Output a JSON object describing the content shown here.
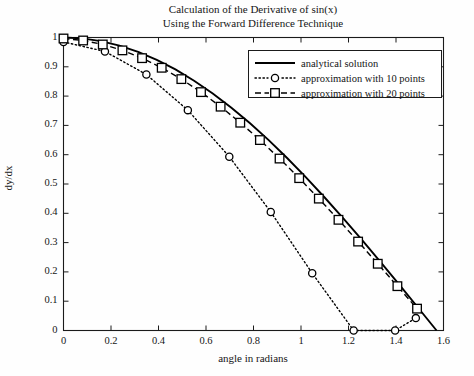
{
  "figure": {
    "title_line1": "Calculation of the Derivative of sin(x)",
    "title_line2": "Using the Forward Difference Technique",
    "xlabel": "angle in radians",
    "ylabel": "dy/dx",
    "background_color": "#fefefe",
    "axis_color": "#1b1b1b"
  },
  "axes": {
    "x_ticklabels": [
      "0",
      "0.2",
      "0.4",
      "0.6",
      "0.8",
      "1",
      "1.2",
      "1.4",
      "1.6"
    ],
    "y_ticklabels": [
      "0",
      "0.1",
      "0.2",
      "0.3",
      "0.4",
      "0.5",
      "0.6",
      "0.7",
      "0.8",
      "0.9",
      "1"
    ]
  },
  "legend": {
    "entries": [
      {
        "label": "analytical solution",
        "style": "solid-line",
        "marker": "none",
        "color": "#000000"
      },
      {
        "label": "approximation with 10 points",
        "style": "dotted-line",
        "marker": "circle",
        "color": "#000000"
      },
      {
        "label": "approximation with 20 points",
        "style": "dashed-line",
        "marker": "square",
        "color": "#000000"
      }
    ]
  },
  "chart_data": {
    "type": "line",
    "title": "Calculation of the Derivative of sin(x) Using the Forward Difference Technique",
    "xlabel": "angle in radians",
    "ylabel": "dy/dx",
    "xlim": [
      0,
      1.6
    ],
    "ylim": [
      0,
      1
    ],
    "xticks": [
      0,
      0.2,
      0.4,
      0.6,
      0.8,
      1,
      1.2,
      1.4,
      1.6
    ],
    "yticks": [
      0,
      0.1,
      0.2,
      0.3,
      0.4,
      0.5,
      0.6,
      0.7,
      0.8,
      0.9,
      1
    ],
    "grid": false,
    "legend_position": "upper right",
    "series": [
      {
        "name": "analytical solution",
        "style": "solid",
        "marker": "none",
        "color": "#000000",
        "x": [
          0,
          0.0785,
          0.1571,
          0.2356,
          0.3142,
          0.3927,
          0.4712,
          0.5498,
          0.6283,
          0.7069,
          0.7854,
          0.8639,
          0.9425,
          1.021,
          1.0996,
          1.1781,
          1.2566,
          1.3352,
          1.4137,
          1.4923,
          1.5708
        ],
        "y": [
          1.0,
          0.9969,
          0.9877,
          0.9724,
          0.9511,
          0.9239,
          0.891,
          0.8526,
          0.809,
          0.7604,
          0.7071,
          0.6496,
          0.5878,
          0.5225,
          0.454,
          0.3827,
          0.309,
          0.2334,
          0.1564,
          0.0785,
          0.0
        ]
      },
      {
        "name": "approximation with 10 points",
        "style": "dotted",
        "marker": "circle",
        "color": "#000000",
        "x": [
          0,
          0.1745,
          0.349,
          0.5236,
          0.6981,
          0.8727,
          1.0472,
          1.2217,
          1.3963,
          1.4835
        ],
        "y": [
          0.9848,
          0.9524,
          0.8738,
          0.7521,
          0.5931,
          0.4045,
          0.1955,
          0.0,
          0.0,
          0.0423
        ]
      },
      {
        "name": "approximation with 20 points",
        "style": "dashed",
        "marker": "square",
        "color": "#000000",
        "x": [
          0,
          0.0827,
          0.1654,
          0.2481,
          0.3308,
          0.4135,
          0.4962,
          0.5789,
          0.6616,
          0.7443,
          0.827,
          0.9097,
          0.9924,
          1.0751,
          1.1578,
          1.2405,
          1.3232,
          1.4059,
          1.4886
        ],
        "y": [
          0.9966,
          0.9898,
          0.9762,
          0.9561,
          0.9295,
          0.8967,
          0.858,
          0.8136,
          0.7639,
          0.7092,
          0.65,
          0.5868,
          0.52,
          0.4501,
          0.3778,
          0.3035,
          0.2278,
          0.1513,
          0.0746
        ]
      }
    ]
  }
}
